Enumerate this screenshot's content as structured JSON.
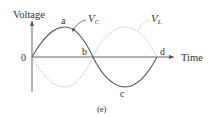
{
  "diagram": {
    "y_axis_label": "Voltage",
    "x_axis_label": "Time",
    "origin_label": "0",
    "point_labels": {
      "a": "a",
      "b": "b",
      "c": "c",
      "d": "d"
    },
    "series": [
      {
        "name": "V",
        "subscript": "C",
        "style": "solid",
        "phase": "sine"
      },
      {
        "name": "V",
        "subscript": "L",
        "style": "dotted",
        "phase": "negative sine"
      }
    ],
    "caption": "(e)",
    "colors": {
      "solid": "#555555",
      "dotted": "#aaaaaa",
      "axes": "#555555"
    }
  }
}
